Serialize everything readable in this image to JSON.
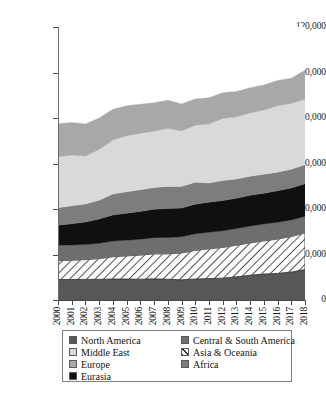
{
  "chart_data": {
    "type": "area",
    "title": "",
    "subtitle": "",
    "xlabel": "",
    "ylabel": "",
    "stacked": true,
    "grid": true,
    "legend_position": "bottom",
    "ylim": [
      0,
      120000
    ],
    "ytick_labels": [
      "0",
      "20,000",
      "40,000",
      "60,000",
      "80,000",
      "100,000",
      "120,000"
    ],
    "ytick_values": [
      0,
      20000,
      40000,
      60000,
      80000,
      100000,
      120000
    ],
    "categories": [
      "2000",
      "2001",
      "2002",
      "2003",
      "2004",
      "2005",
      "2006",
      "2007",
      "2008",
      "2009",
      "2010",
      "2011",
      "2012",
      "2013",
      "2014",
      "2015",
      "2016",
      "2017",
      "2018"
    ],
    "x": [
      2000,
      2001,
      2002,
      2003,
      2004,
      2005,
      2006,
      2007,
      2008,
      2009,
      2010,
      2011,
      2012,
      2013,
      2014,
      2015,
      2016,
      2017,
      2018
    ],
    "series": [
      {
        "name": "North America",
        "color": "#575757",
        "pattern": "solid",
        "values": [
          9000,
          9000,
          9050,
          9100,
          9200,
          9200,
          9150,
          9300,
          9100,
          8900,
          9200,
          9400,
          9600,
          10200,
          10900,
          11400,
          11700,
          12300,
          13400
        ]
      },
      {
        "name": "Asia & Oceania",
        "color": "#ffffff",
        "pattern": "diagonal-hatch",
        "values": [
          8300,
          8500,
          8700,
          9100,
          9800,
          10200,
          10600,
          11000,
          11200,
          11800,
          12600,
          13100,
          13500,
          13900,
          14200,
          14600,
          15100,
          15600,
          16100
        ]
      },
      {
        "name": "Central & South America",
        "color": "#6e6e6e",
        "pattern": "solid",
        "values": [
          6800,
          6700,
          6600,
          6700,
          6900,
          6900,
          7000,
          7100,
          7200,
          7100,
          7300,
          7300,
          7300,
          7300,
          7400,
          7400,
          7400,
          7300,
          7300
        ]
      },
      {
        "name": "Eurasia",
        "color": "#101010",
        "pattern": "solid",
        "values": [
          8800,
          9300,
          9900,
          10700,
          11500,
          11800,
          12200,
          12500,
          12700,
          12600,
          13000,
          13200,
          13300,
          13300,
          13500,
          13500,
          13800,
          14000,
          14300
        ]
      },
      {
        "name": "Africa",
        "color": "#7d7d7d",
        "pattern": "solid",
        "values": [
          7600,
          7900,
          7900,
          8300,
          9200,
          9500,
          9500,
          9500,
          9700,
          9500,
          9700,
          8400,
          8800,
          8500,
          8400,
          8400,
          8200,
          8300,
          8400
        ]
      },
      {
        "name": "Middle East",
        "color": "#d9d9d9",
        "pattern": "solid",
        "values": [
          22500,
          22300,
          21100,
          22300,
          23700,
          24600,
          24800,
          24800,
          25600,
          24400,
          25000,
          26000,
          27300,
          27300,
          27800,
          28200,
          29200,
          28900,
          28800
        ]
      },
      {
        "name": "Europe",
        "color": "#a8a8a8",
        "pattern": "solid",
        "values": [
          14500,
          14300,
          14100,
          13800,
          13500,
          13200,
          12800,
          12500,
          12300,
          11900,
          11600,
          11500,
          11300,
          11200,
          11100,
          11000,
          11100,
          11100,
          12700
        ]
      }
    ],
    "totals": [
      77500,
      78000,
      77350,
      80000,
      83800,
      85400,
      86050,
      86700,
      87800,
      86200,
      88400,
      88900,
      91100,
      91700,
      93300,
      94500,
      96500,
      97500,
      101000
    ]
  },
  "legend": {
    "left_column": [
      {
        "label": "North America",
        "swatch": "na-swatch"
      },
      {
        "label": "Middle East",
        "swatch": "me-swatch"
      },
      {
        "label": "Europe",
        "swatch": "eu-swatch"
      },
      {
        "label": "Eurasia",
        "swatch": "eurasia-swatch"
      }
    ],
    "right_column": [
      {
        "label": "Central & South America",
        "swatch": "csa-swatch"
      },
      {
        "label": "Asia & Oceania",
        "swatch": "ao-swatch"
      },
      {
        "label": "Africa",
        "swatch": "africa-swatch"
      }
    ]
  }
}
